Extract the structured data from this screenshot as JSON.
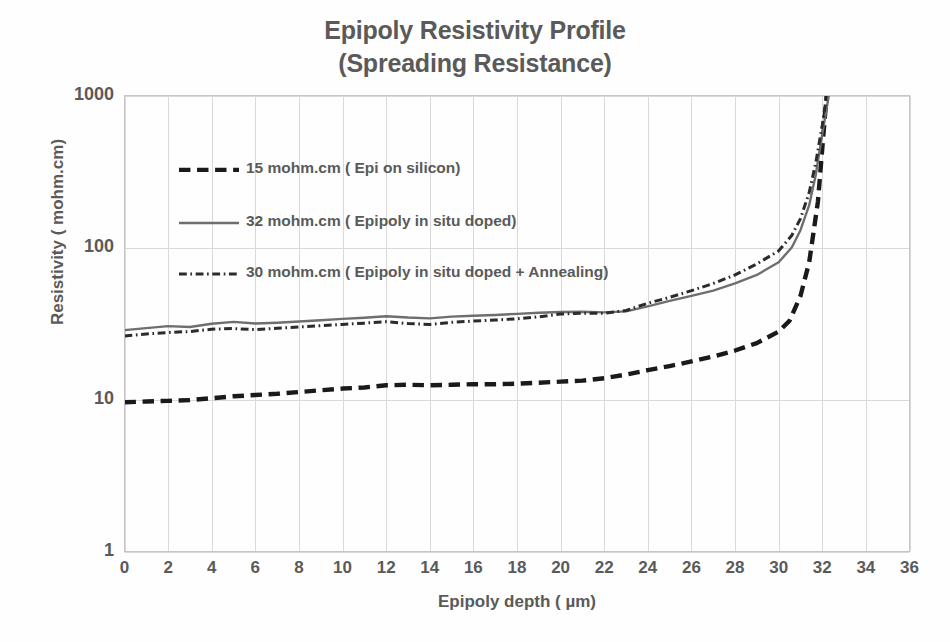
{
  "chart_data": {
    "type": "line",
    "title": "Epipoly Resistivity Profile",
    "subtitle": "(Spreading Resistance)",
    "xlabel": "Epipoly depth ( µm)",
    "ylabel": "Resistivity ( mohm.cm)",
    "xlim": [
      0,
      36
    ],
    "ylim": [
      1,
      1000
    ],
    "yscale": "log",
    "xticks": [
      0,
      2,
      4,
      6,
      8,
      10,
      12,
      14,
      16,
      18,
      20,
      22,
      24,
      26,
      28,
      30,
      32,
      34,
      36
    ],
    "yticks": [
      1,
      10,
      100,
      1000
    ],
    "ytick_labels": [
      "1",
      "10",
      "100",
      "1000"
    ],
    "grid": "both-major",
    "legend_position": "inside-upper-left",
    "series": [
      {
        "name": "15 mohm.cm ( Epi on silicon)",
        "style": "dashed",
        "color": "#1a1a1a",
        "width": 4.4,
        "x": [
          0,
          1,
          2,
          3,
          4,
          5,
          6,
          7,
          8,
          9,
          10,
          11,
          12,
          13,
          14,
          15,
          16,
          17,
          18,
          19,
          20,
          21,
          22,
          23,
          24,
          25,
          26,
          27,
          28,
          29,
          30,
          30.5,
          31,
          31.4,
          31.8,
          32,
          32.2
        ],
        "y": [
          9.6,
          9.7,
          9.8,
          9.9,
          10.2,
          10.5,
          10.7,
          10.9,
          11.2,
          11.5,
          11.8,
          12.0,
          12.4,
          12.5,
          12.4,
          12.5,
          12.6,
          12.6,
          12.7,
          12.9,
          13.1,
          13.3,
          13.8,
          14.6,
          15.6,
          16.6,
          17.8,
          19.2,
          21.0,
          23.5,
          28.0,
          33.0,
          48.0,
          80.0,
          200.0,
          450.0,
          1000.0
        ]
      },
      {
        "name": "32 mohm.cm  ( Epipoly in situ doped)",
        "style": "solid",
        "color": "#6e6e6e",
        "width": 2.4,
        "x": [
          0,
          1,
          2,
          3,
          4,
          5,
          6,
          7,
          8,
          9,
          10,
          11,
          12,
          13,
          14,
          15,
          16,
          17,
          18,
          19,
          20,
          21,
          22,
          23,
          24,
          25,
          26,
          27,
          28,
          29,
          30,
          30.6,
          31,
          31.4,
          31.7,
          32,
          32.3
        ],
        "y": [
          28.6,
          29.5,
          30.4,
          30.0,
          31.5,
          32.4,
          31.6,
          32.0,
          32.6,
          33.2,
          33.9,
          34.5,
          35.3,
          34.6,
          34.2,
          35.1,
          35.6,
          36.0,
          36.6,
          37.2,
          37.6,
          37.8,
          37.4,
          38.0,
          41.0,
          44.5,
          48.0,
          52.0,
          58.0,
          66.0,
          80.0,
          100.0,
          130.0,
          190.0,
          300.0,
          560.0,
          1000.0
        ]
      },
      {
        "name": "30 mohm.cm  ( Epipoly in situ doped + Annealing)",
        "style": "dashdot",
        "color": "#2b2b2b",
        "width": 3.0,
        "x": [
          0,
          1,
          2,
          3,
          4,
          5,
          6,
          7,
          8,
          9,
          10,
          11,
          12,
          13,
          14,
          15,
          16,
          17,
          18,
          19,
          20,
          21,
          22,
          23,
          24,
          25,
          26,
          27,
          28,
          29,
          30,
          30.6,
          31,
          31.4,
          31.7,
          32,
          32.2
        ],
        "y": [
          26.2,
          27.0,
          27.6,
          28.0,
          29.0,
          29.3,
          28.8,
          29.4,
          30.0,
          30.6,
          31.2,
          31.8,
          32.5,
          31.6,
          31.2,
          32.2,
          32.8,
          33.3,
          34.0,
          35.0,
          36.5,
          37.0,
          36.9,
          38.5,
          43.0,
          47.0,
          52.0,
          58.0,
          66.0,
          78.0,
          95.0,
          120.0,
          155.0,
          230.0,
          360.0,
          640.0,
          1000.0
        ]
      }
    ]
  },
  "axes": {
    "ylabel": "Resistivity ( mohm.cm)",
    "xlabel": "Epipoly depth ( µm)",
    "xtick_labels": [
      "0",
      "2",
      "4",
      "6",
      "8",
      "10",
      "12",
      "14",
      "16",
      "18",
      "20",
      "22",
      "24",
      "26",
      "28",
      "30",
      "32",
      "34",
      "36"
    ],
    "ytick_labels": [
      "1",
      "10",
      "100",
      "1000"
    ]
  },
  "title": {
    "line1": "Epipoly Resistivity Profile",
    "line2": "(Spreading Resistance)"
  },
  "legend": {
    "items": [
      {
        "label": "15 mohm.cm ( Epi on silicon)",
        "style": "dashed"
      },
      {
        "label": "32 mohm.cm  ( Epipoly in situ doped)",
        "style": "solid"
      },
      {
        "label": "30 mohm.cm  ( Epipoly in situ doped + Annealing)",
        "style": "dashdot"
      }
    ]
  },
  "colors": {
    "background": "#fefefe",
    "text": "#5a5a5a",
    "grid": "#d9d9d9",
    "axis": "#bfbfbf",
    "series_dashed": "#1a1a1a",
    "series_solid": "#6e6e6e",
    "series_dashdot": "#2b2b2b"
  }
}
